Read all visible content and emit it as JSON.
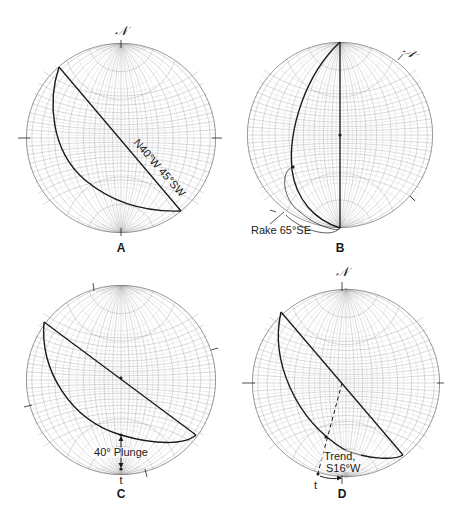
{
  "figure": {
    "north_symbol": "𝒩",
    "colors": {
      "grid": "#8a8a8a",
      "grid_dense": "#b0b0b0",
      "ink": "#1a1a1a",
      "background": "#ffffff"
    }
  },
  "panels": [
    {
      "id": "A",
      "letter": "A",
      "north_label": "𝒩",
      "plane_label": "N40°W 45°SW",
      "elements": [
        "great-circle",
        "strike-line",
        "north-tick",
        "side-ticks"
      ]
    },
    {
      "id": "B",
      "letter": "B",
      "north_label": "𝒩",
      "rake_label": "Rake 65°SE",
      "elements": [
        "great-circle rotated to N-S",
        "rotated north mark",
        "center point",
        "rake point"
      ]
    },
    {
      "id": "C",
      "letter": "C",
      "plunge_label": "40° Plunge",
      "t_label": "t",
      "elements": [
        "great-circle",
        "strike-line",
        "plunge arrow",
        "center point"
      ]
    },
    {
      "id": "D",
      "letter": "D",
      "north_label": "𝒩",
      "trend_label_line1": "Trend,",
      "trend_label_line2": "S16°W",
      "t_label": "t",
      "elements": [
        "great-circle",
        "strike-line",
        "dashed trend line",
        "trend arrow"
      ]
    }
  ]
}
